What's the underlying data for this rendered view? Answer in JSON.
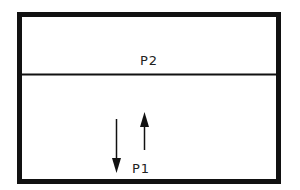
{
  "diagram": {
    "type": "two-layer-box",
    "colors": {
      "stroke": "#111111",
      "background": "#ffffff"
    },
    "regions": [
      {
        "id": "upper",
        "label": "P2"
      },
      {
        "id": "lower",
        "label": "P1"
      }
    ],
    "arrows": [
      {
        "id": "down-arrow",
        "direction": "down",
        "region": "lower"
      },
      {
        "id": "up-arrow",
        "direction": "up",
        "region": "lower"
      }
    ]
  }
}
